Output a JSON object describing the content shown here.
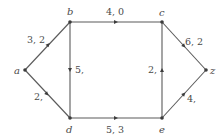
{
  "diagram": {
    "type": "directed flow network",
    "nodes": [
      {
        "id": "a",
        "label": "a",
        "x": 25,
        "y": 70
      },
      {
        "id": "b",
        "label": "b",
        "x": 70,
        "y": 22
      },
      {
        "id": "c",
        "label": "c",
        "x": 162,
        "y": 22
      },
      {
        "id": "d",
        "label": "d",
        "x": 70,
        "y": 118
      },
      {
        "id": "e",
        "label": "e",
        "x": 162,
        "y": 118
      },
      {
        "id": "z",
        "label": "z",
        "x": 206,
        "y": 70
      }
    ],
    "edges": [
      {
        "from": "a",
        "to": "b",
        "label": "3, 2"
      },
      {
        "from": "b",
        "to": "c",
        "label": "4, 0"
      },
      {
        "from": "c",
        "to": "z",
        "label": "6, 2"
      },
      {
        "from": "b",
        "to": "d",
        "label": "5,"
      },
      {
        "from": "e",
        "to": "c",
        "label": "2,"
      },
      {
        "from": "a",
        "to": "d",
        "label": "2,"
      },
      {
        "from": "d",
        "to": "e",
        "label": "5, 3"
      },
      {
        "from": "e",
        "to": "z",
        "label": "4,"
      }
    ]
  },
  "labels": {
    "node_a": "a",
    "node_b": "b",
    "node_c": "c",
    "node_d": "d",
    "node_e": "e",
    "node_z": "z",
    "edge_ab": "3, 2",
    "edge_bc": "4, 0",
    "edge_cz": "6, 2",
    "edge_bd": "5,",
    "edge_ec": "2,",
    "edge_ad": "2,",
    "edge_de": "5, 3",
    "edge_ez": "4,"
  },
  "colors": {
    "line": "#5a5a5a",
    "node": "#3c3c3c",
    "text": "#4a4a4a",
    "background": "#ffffff"
  }
}
